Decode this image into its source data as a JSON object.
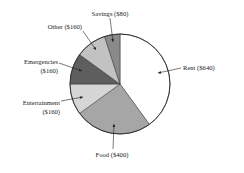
{
  "chart_data": {
    "type": "pie",
    "title": "",
    "start": "top",
    "direction": "clockwise",
    "slices": [
      {
        "name": "Rent",
        "value": 640,
        "label_lines": [
          "Rent ($640)"
        ],
        "color": "#ffffff"
      },
      {
        "name": "Food",
        "value": 400,
        "label_lines": [
          "Food ($400)"
        ],
        "color": "#a6a6a6"
      },
      {
        "name": "Entertainment",
        "value": 160,
        "label_lines": [
          "Entertainment",
          "($160)"
        ],
        "color": "#d6d6d6"
      },
      {
        "name": "Emergencies",
        "value": 160,
        "label_lines": [
          "Emergencies",
          "($160)"
        ],
        "color": "#5e5e5e"
      },
      {
        "name": "Other",
        "value": 160,
        "label_lines": [
          "Other ($160)"
        ],
        "color": "#c2c2c2"
      },
      {
        "name": "Savings",
        "value": 80,
        "label_lines": [
          "Savings ($80)"
        ],
        "color": "#8a8a8a"
      }
    ],
    "total": 1600
  }
}
